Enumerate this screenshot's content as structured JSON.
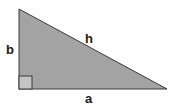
{
  "diagram": {
    "type": "right-triangle",
    "labels": {
      "vertical_leg": "b",
      "hypotenuse": "h",
      "horizontal_leg": "a"
    },
    "colors": {
      "fill": "#a3a3a3",
      "stroke": "#3a3a3a",
      "right_angle_fill": "#c4c4c4"
    }
  }
}
